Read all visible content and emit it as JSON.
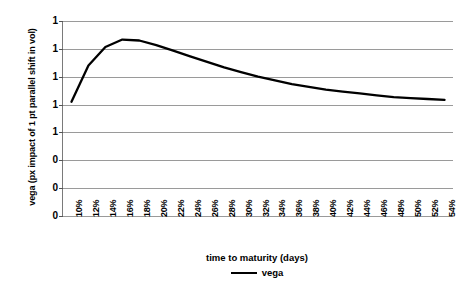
{
  "chart_data": {
    "type": "line",
    "title": "",
    "xlabel": "time to maturity (days)",
    "ylabel": "vega (px impact of 1 pt parallel shift in vol)",
    "grid": true,
    "legend_position": "bottom",
    "xlim": [
      "10%",
      "54%"
    ],
    "ylim": [
      0.0,
      2.1
    ],
    "y_ticks": [
      "1",
      "1",
      "1",
      "1",
      "1",
      "0",
      "0",
      "0"
    ],
    "y_tick_values": [
      2.1,
      1.8,
      1.5,
      1.2,
      0.9,
      0.6,
      0.3,
      0.0
    ],
    "categories": [
      "10%",
      "12%",
      "14%",
      "16%",
      "18%",
      "20%",
      "22%",
      "24%",
      "26%",
      "28%",
      "30%",
      "32%",
      "34%",
      "36%",
      "38%",
      "40%",
      "42%",
      "44%",
      "46%",
      "48%",
      "50%",
      "52%",
      "54%"
    ],
    "series": [
      {
        "name": "vega",
        "color": "#000000",
        "values": [
          1.23,
          1.62,
          1.82,
          1.9,
          1.89,
          1.84,
          1.78,
          1.72,
          1.66,
          1.6,
          1.55,
          1.5,
          1.46,
          1.42,
          1.39,
          1.36,
          1.34,
          1.32,
          1.3,
          1.28,
          1.27,
          1.26,
          1.25
        ]
      }
    ]
  },
  "axes": {
    "y_title": "vega (px impact of 1 pt parallel shift in vol)",
    "x_title": "time to maturity (days)"
  },
  "legend": {
    "entries": [
      {
        "label": "vega",
        "color": "#000000"
      }
    ]
  },
  "colors": {
    "series_line": "#000000",
    "gridline": "#9a9a9a",
    "axis": "#7a7a7a",
    "background": "#ffffff"
  }
}
